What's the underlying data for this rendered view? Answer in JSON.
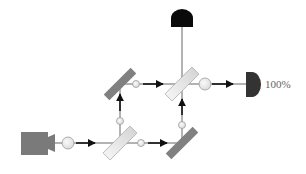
{
  "diagram": {
    "colors": {
      "beam": "#666666",
      "arrow": "#111111",
      "source": "#7a7a7a",
      "mirror": "#808080",
      "splitter_fill": "#e6e6e6",
      "splitter_stroke": "#b0b0b0",
      "photon_fill": "#ececec",
      "photon_stroke": "#9a9a9a",
      "detector_top": "#0a0a0a",
      "detector_right": "#333333",
      "label": "#666666"
    },
    "source": {
      "name": "laser-source",
      "x": 21,
      "y": 132,
      "w": 27,
      "h": 23
    },
    "components": [
      {
        "name": "beam-splitter-input",
        "type": "splitter",
        "cx": 120,
        "cy": 143
      },
      {
        "name": "mirror-bottom-right",
        "type": "mirror",
        "cx": 182,
        "cy": 143
      },
      {
        "name": "mirror-top-left",
        "type": "mirror",
        "cx": 120,
        "cy": 84
      },
      {
        "name": "beam-splitter-output",
        "type": "splitter",
        "cx": 182,
        "cy": 84
      }
    ],
    "photons": [
      {
        "cx": 68,
        "cy": 143,
        "r": 6
      },
      {
        "cx": 141,
        "cy": 143,
        "r": 4
      },
      {
        "cx": 120,
        "cy": 121,
        "r": 4
      },
      {
        "cx": 182,
        "cy": 125,
        "r": 4
      },
      {
        "cx": 136,
        "cy": 84,
        "r": 4
      },
      {
        "cx": 205,
        "cy": 84,
        "r": 6
      }
    ],
    "detectors": [
      {
        "name": "detector-top",
        "position": "top"
      },
      {
        "name": "detector-right",
        "position": "right",
        "label": "100%"
      }
    ]
  }
}
